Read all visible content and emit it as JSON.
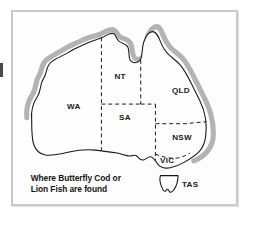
{
  "figure": {
    "kind": "map-illustration",
    "background_color": "#ffffff"
  },
  "panel": {
    "border_color": "#c9c9c9",
    "fill_color": "#fdfdfd"
  },
  "map": {
    "land_fill": "#fefefe",
    "outline_color": "#1a1a1a",
    "state_border_style": "dashed",
    "highlight_band_color": "#b3b3b3",
    "highlight_meaning": "coastal distribution band",
    "states": [
      {
        "code": "WA",
        "label": "WA",
        "x": 62,
        "y": 96
      },
      {
        "code": "NT",
        "label": "NT",
        "x": 109,
        "y": 78
      },
      {
        "code": "QLD",
        "label": "QLD",
        "x": 172,
        "y": 90
      },
      {
        "code": "SA",
        "label": "SA",
        "x": 114,
        "y": 117
      },
      {
        "code": "NSW",
        "label": "NSW",
        "x": 172,
        "y": 133
      },
      {
        "code": "VIC",
        "label": "VIC",
        "x": 157,
        "y": 157
      }
    ]
  },
  "legend": {
    "tasmania_label": "TAS",
    "tasmania_symbol": "tasmania-outline-icon"
  },
  "caption": {
    "line1": "Where Butterfly Cod or",
    "line2": "Lion Fish are found"
  }
}
